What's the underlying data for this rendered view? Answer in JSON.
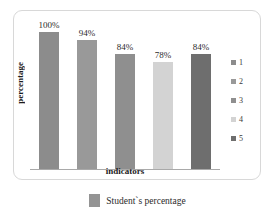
{
  "chart_data": {
    "type": "bar",
    "title": "",
    "subtitle": "",
    "xlabel": "indicators",
    "ylabel": "percentage",
    "categories": [
      "1",
      "2",
      "3",
      "4",
      "5"
    ],
    "values": [
      100,
      94,
      84,
      78,
      84
    ],
    "data_labels": [
      "100%",
      "94%",
      "84%",
      "78%",
      "84%"
    ],
    "ylim": [
      0,
      110
    ],
    "grid": false,
    "y_ticks_visible": false,
    "x_ticks_visible": false,
    "legend_position": "right",
    "bar_colors": [
      "#8c8c8c",
      "#999999",
      "#8f8f8f",
      "#d3d3d3",
      "#6e6e6e"
    ],
    "series": [
      {
        "name": "Student`s percentage",
        "values": [
          100,
          94,
          84,
          78,
          84
        ]
      }
    ]
  },
  "side_legend": {
    "items": [
      {
        "key": "1",
        "color": "#8c8c8c"
      },
      {
        "key": "2",
        "color": "#999999"
      },
      {
        "key": "3",
        "color": "#8f8f8f"
      },
      {
        "key": "4",
        "color": "#d3d3d3"
      },
      {
        "key": "5",
        "color": "#6e6e6e"
      }
    ]
  },
  "bottom_legend": {
    "label": "Student`s percentage",
    "color": "#949494"
  },
  "axes": {
    "x_title": "indicators",
    "y_title": "percentage",
    "baseline_color": "#a9a9a9"
  },
  "frame": {
    "border_color": "#d8d8d8",
    "background": "#ffffff"
  }
}
